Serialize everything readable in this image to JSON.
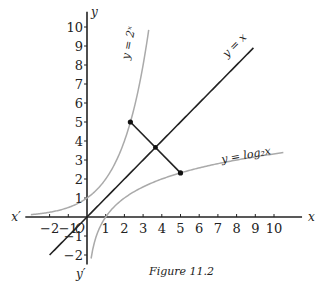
{
  "chart_data": {
    "type": "line",
    "title": "",
    "caption": "Figure 11.2",
    "xlabel": "x",
    "ylabel": "y",
    "x_neg_label": "x′",
    "y_neg_label": "y′",
    "origin_label": "O",
    "xlim": [
      -3.3,
      11.5
    ],
    "ylim": [
      -2.5,
      10.8
    ],
    "x_ticks": [
      -2,
      -1,
      1,
      2,
      3,
      4,
      5,
      6,
      7,
      8,
      9,
      10
    ],
    "x_tick_labels": [
      "−2",
      "−1",
      "1",
      "2",
      "3",
      "4",
      "5",
      "6",
      "7",
      "8",
      "9",
      "10"
    ],
    "y_ticks": [
      -2,
      -1,
      1,
      2,
      3,
      4,
      5,
      6,
      7,
      8,
      9,
      10
    ],
    "y_tick_labels": [
      "−2",
      "−1",
      "1",
      "2",
      "3",
      "4",
      "5",
      "6",
      "7",
      "8",
      "9",
      "10"
    ],
    "grid": false,
    "series": [
      {
        "name": "y = 2^x",
        "label": "y = 2ˣ",
        "function": "exp2",
        "x_range": [
          -3,
          3.3
        ],
        "color": "#aaaaaa"
      },
      {
        "name": "y = x",
        "label": "y = x",
        "function": "identity",
        "x_range": [
          -2,
          8.9
        ],
        "color": "#222222"
      },
      {
        "name": "y = log2 x",
        "label": "y = log₂x",
        "function": "log2",
        "x_range": [
          0.22,
          10.5
        ],
        "color": "#aaaaaa"
      }
    ],
    "points": [
      {
        "x": 2.32,
        "y": 5
      },
      {
        "x": 5,
        "y": 2.32
      }
    ],
    "segment": {
      "from": [
        2.32,
        5
      ],
      "to": [
        5,
        2.32
      ]
    }
  }
}
